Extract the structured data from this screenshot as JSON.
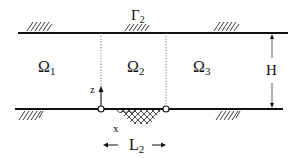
{
  "diagram": {
    "type": "channel-domain-schematic",
    "top_boundary_label": "Γ",
    "top_boundary_sub": "2",
    "regions": [
      {
        "symbol": "Ω",
        "sub": "1"
      },
      {
        "symbol": "Ω",
        "sub": "2"
      },
      {
        "symbol": "Ω",
        "sub": "3"
      }
    ],
    "height_label": "H",
    "axis_z_label": "z",
    "axis_x_label": "x",
    "length_label": "L",
    "length_sub": "2",
    "colors": {
      "line": "#111111",
      "dotted": "#555555",
      "background": "#ffffff"
    }
  }
}
